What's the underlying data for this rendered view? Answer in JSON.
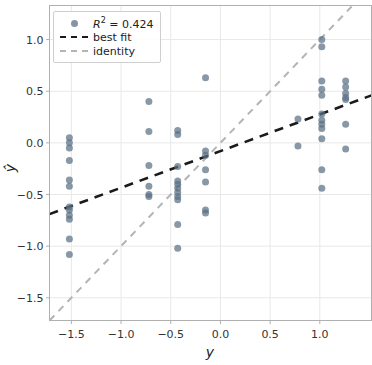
{
  "chart_data": {
    "type": "scatter",
    "title": "",
    "xlabel": "y",
    "ylabel": "ŷ",
    "xlim": [
      -1.72,
      1.52
    ],
    "ylim": [
      -1.72,
      1.33
    ],
    "xticks": [
      "-1.5",
      "-1.0",
      "-0.5",
      "0.0",
      "0.5",
      "1.0"
    ],
    "xtick_values": [
      -1.5,
      -1.0,
      -0.5,
      0.0,
      0.5,
      1.0
    ],
    "yticks": [
      "1.0",
      "0.5",
      "0.0",
      "-0.5",
      "-1.0",
      "-1.5"
    ],
    "ytick_values": [
      1.0,
      0.5,
      0.0,
      -0.5,
      -1.0,
      -1.5
    ],
    "grid": true,
    "grid_color": "#e8e8e8",
    "point_color": "#5c7085",
    "point_opacity": 0.72,
    "point_size": 7,
    "legend_position": "upper left",
    "legend": [
      {
        "key": "marker",
        "label_html": "R² = 0.424",
        "label": "R^2 = 0.424",
        "color": "#5c7085"
      },
      {
        "key": "dashed-line",
        "label_html": "best fit",
        "label": "best fit",
        "color": "#1a1a1a"
      },
      {
        "key": "dashed-line",
        "label_html": "identity",
        "label": "identity",
        "color": "#b4b4b4"
      }
    ],
    "r_squared": 0.424,
    "lines": [
      {
        "name": "best fit",
        "style": "dashed",
        "color": "#1a1a1a",
        "width": 2.6,
        "slope": 0.355,
        "intercept": -0.08,
        "x_endpoints": [
          -1.72,
          1.52
        ],
        "y_endpoints": [
          -0.69,
          0.46
        ]
      },
      {
        "name": "identity",
        "style": "dashed",
        "color": "#b4b4b4",
        "width": 2.0,
        "slope": 1.0,
        "intercept": 0.0,
        "x_endpoints": [
          -1.72,
          1.32
        ],
        "y_endpoints": [
          -1.72,
          1.32
        ]
      }
    ],
    "points": [
      [
        -1.52,
        0.05
      ],
      [
        -1.52,
        0.0
      ],
      [
        -1.52,
        -0.05
      ],
      [
        -1.52,
        -0.17
      ],
      [
        -1.52,
        -0.36
      ],
      [
        -1.52,
        -0.42
      ],
      [
        -1.52,
        -0.62
      ],
      [
        -1.52,
        -0.65
      ],
      [
        -1.52,
        -0.7
      ],
      [
        -1.52,
        -0.74
      ],
      [
        -1.52,
        -0.93
      ],
      [
        -1.52,
        -1.08
      ],
      [
        -0.72,
        0.4
      ],
      [
        -0.72,
        0.11
      ],
      [
        -0.72,
        -0.22
      ],
      [
        -0.72,
        -0.42
      ],
      [
        -0.72,
        -0.5
      ],
      [
        -0.72,
        -0.52
      ],
      [
        -0.43,
        0.12
      ],
      [
        -0.43,
        0.08
      ],
      [
        -0.43,
        -0.23
      ],
      [
        -0.43,
        -0.37
      ],
      [
        -0.43,
        -0.4
      ],
      [
        -0.43,
        -0.44
      ],
      [
        -0.43,
        -0.48
      ],
      [
        -0.43,
        -0.52
      ],
      [
        -0.43,
        -0.55
      ],
      [
        -0.43,
        -0.79
      ],
      [
        -0.43,
        -1.02
      ],
      [
        -0.15,
        0.63
      ],
      [
        -0.15,
        -0.08
      ],
      [
        -0.15,
        -0.12
      ],
      [
        -0.15,
        -0.26
      ],
      [
        -0.15,
        -0.38
      ],
      [
        -0.15,
        -0.65
      ],
      [
        -0.15,
        -0.68
      ],
      [
        0.78,
        0.23
      ],
      [
        0.78,
        -0.03
      ],
      [
        1.02,
        1.0
      ],
      [
        1.02,
        0.93
      ],
      [
        1.02,
        0.6
      ],
      [
        1.02,
        0.52
      ],
      [
        1.02,
        0.46
      ],
      [
        1.02,
        0.28
      ],
      [
        1.02,
        0.22
      ],
      [
        1.02,
        0.18
      ],
      [
        1.02,
        0.14
      ],
      [
        1.02,
        0.04
      ],
      [
        1.02,
        -0.26
      ],
      [
        1.02,
        -0.44
      ],
      [
        1.26,
        0.6
      ],
      [
        1.26,
        0.54
      ],
      [
        1.26,
        0.48
      ],
      [
        1.26,
        0.44
      ],
      [
        1.26,
        0.42
      ],
      [
        1.26,
        0.18
      ],
      [
        1.26,
        -0.06
      ]
    ]
  }
}
